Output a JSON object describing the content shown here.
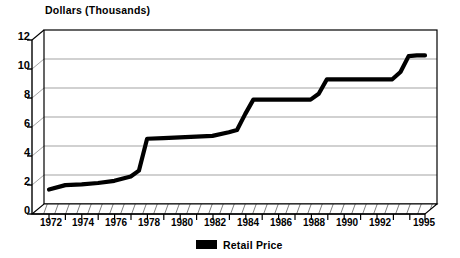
{
  "chart_data": {
    "type": "line",
    "title": "Dollars (Thousands)",
    "xlabel": "",
    "ylabel": "Dollars (Thousands)",
    "xlim": [
      1972,
      1995
    ],
    "ylim": [
      0,
      12
    ],
    "grid": true,
    "legend_position": "bottom-center",
    "style": "3d-wall",
    "series": [
      {
        "name": "Retail Price",
        "color": "#000000",
        "x": [
          1972,
          1973,
          1974,
          1975,
          1976,
          1977,
          1977.5,
          1978,
          1979,
          1980,
          1981,
          1982,
          1983,
          1983.5,
          1984,
          1984.5,
          1985,
          1986,
          1987,
          1988,
          1988.5,
          1989,
          1990,
          1991,
          1992,
          1993,
          1993.5,
          1994,
          1994.5,
          1995
        ],
        "values": [
          1.0,
          1.3,
          1.35,
          1.45,
          1.6,
          1.9,
          2.3,
          4.5,
          4.55,
          4.6,
          4.65,
          4.7,
          4.95,
          5.1,
          6.2,
          7.2,
          7.2,
          7.2,
          7.2,
          7.2,
          7.6,
          8.6,
          8.6,
          8.6,
          8.6,
          8.6,
          9.1,
          10.2,
          10.25,
          10.25
        ]
      }
    ],
    "y_ticks": [
      0,
      2,
      4,
      6,
      8,
      10,
      12
    ],
    "y_tick_labels": [
      "0",
      "2",
      "4",
      "6",
      "8",
      "10",
      "12"
    ],
    "x_tick_labels": [
      "1972",
      "1974",
      "1976",
      "1978",
      "1980",
      "1982",
      "1984",
      "1986",
      "1988",
      "1990",
      "1992",
      "1995"
    ],
    "x_tick_values": [
      1972,
      1974,
      1976,
      1978,
      1980,
      1982,
      1984,
      1986,
      1988,
      1990,
      1992,
      1995
    ],
    "x_minor_interval": 1
  },
  "legend": {
    "entries": [
      {
        "label": "Retail Price",
        "color": "#000000"
      }
    ]
  },
  "colors": {
    "line": "#000000",
    "grid": "#999999",
    "frame": "#000000",
    "background": "#ffffff"
  }
}
